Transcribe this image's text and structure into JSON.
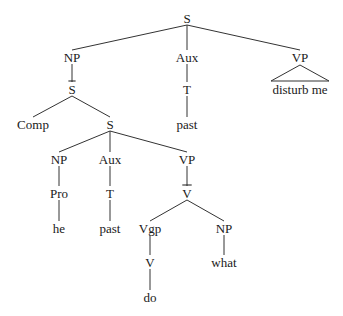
{
  "diagram": {
    "type": "syntax-tree",
    "nodes": [
      {
        "id": "s_root",
        "label": "S",
        "x": 187,
        "y": 18
      },
      {
        "id": "np1",
        "label": "NP",
        "x": 72,
        "y": 57
      },
      {
        "id": "aux1",
        "label": "Aux",
        "x": 187,
        "y": 57
      },
      {
        "id": "vp1",
        "label": "VP",
        "x": 300,
        "y": 57
      },
      {
        "id": "sbar",
        "label": "S",
        "x": 72,
        "y": 89,
        "overbar": true
      },
      {
        "id": "t1",
        "label": "T",
        "x": 187,
        "y": 89
      },
      {
        "id": "vp1_text",
        "label": "disturb me",
        "x": 300,
        "y": 89
      },
      {
        "id": "comp",
        "label": "Comp",
        "x": 33,
        "y": 124
      },
      {
        "id": "s2",
        "label": "S",
        "x": 110,
        "y": 124
      },
      {
        "id": "past1",
        "label": "past",
        "x": 187,
        "y": 124
      },
      {
        "id": "np2",
        "label": "NP",
        "x": 59,
        "y": 159
      },
      {
        "id": "aux2",
        "label": "Aux",
        "x": 110,
        "y": 159
      },
      {
        "id": "vp2",
        "label": "VP",
        "x": 187,
        "y": 159
      },
      {
        "id": "pro",
        "label": "Pro",
        "x": 59,
        "y": 193
      },
      {
        "id": "t2",
        "label": "T",
        "x": 110,
        "y": 193
      },
      {
        "id": "vbar",
        "label": "V",
        "x": 187,
        "y": 193,
        "overbar": true
      },
      {
        "id": "he",
        "label": "he",
        "x": 59,
        "y": 228
      },
      {
        "id": "past2",
        "label": "past",
        "x": 110,
        "y": 228
      },
      {
        "id": "vgp",
        "label": "Vgp",
        "x": 150,
        "y": 228
      },
      {
        "id": "np3",
        "label": "NP",
        "x": 224,
        "y": 228
      },
      {
        "id": "v",
        "label": "V",
        "x": 150,
        "y": 262
      },
      {
        "id": "what",
        "label": "what",
        "x": 224,
        "y": 262
      },
      {
        "id": "do",
        "label": "do",
        "x": 150,
        "y": 297
      }
    ],
    "edges": [
      [
        "s_root",
        "np1"
      ],
      [
        "s_root",
        "aux1"
      ],
      [
        "s_root",
        "vp1"
      ],
      [
        "np1",
        "sbar"
      ],
      [
        "aux1",
        "t1"
      ],
      [
        "sbar",
        "comp"
      ],
      [
        "sbar",
        "s2"
      ],
      [
        "t1",
        "past1"
      ],
      [
        "s2",
        "np2"
      ],
      [
        "s2",
        "aux2"
      ],
      [
        "s2",
        "vp2"
      ],
      [
        "np2",
        "pro"
      ],
      [
        "aux2",
        "t2"
      ],
      [
        "vp2",
        "vbar"
      ],
      [
        "pro",
        "he"
      ],
      [
        "t2",
        "past2"
      ],
      [
        "vbar",
        "vgp"
      ],
      [
        "vbar",
        "np3"
      ],
      [
        "vgp",
        "v"
      ],
      [
        "np3",
        "what"
      ],
      [
        "v",
        "do"
      ]
    ],
    "triangles": [
      {
        "parent": "vp1",
        "apex": [
          300,
          65
        ],
        "left": [
          271,
          81
        ],
        "right": [
          329,
          81
        ],
        "text_node": "vp1_text"
      }
    ],
    "line_color": "#333333",
    "text_color": "#1a1a1a"
  }
}
